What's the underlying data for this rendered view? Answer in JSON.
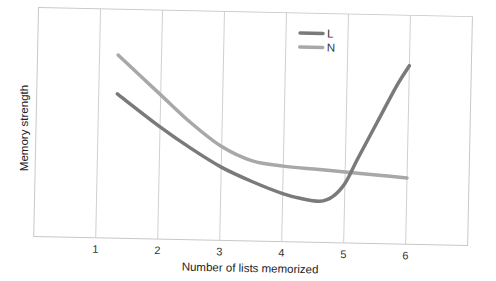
{
  "chart_data": {
    "type": "line",
    "title": "",
    "xlabel": "Number of lists memorized",
    "ylabel": "Memory strength",
    "xlim": [
      0,
      7
    ],
    "ylim": [
      0,
      10
    ],
    "x_ticks": [
      "1",
      "2",
      "3",
      "4",
      "5",
      "6"
    ],
    "grid": {
      "vertical": true,
      "horizontal": false
    },
    "legend_position": "upper-right",
    "series": [
      {
        "name": "L",
        "color": "#7a7a7a",
        "x": [
          1.3,
          2.0,
          2.5,
          3.0,
          3.5,
          4.0,
          4.3,
          4.6,
          4.8,
          5.0,
          5.2,
          5.5,
          5.8,
          6.0
        ],
        "y": [
          6.3,
          4.9,
          4.0,
          3.2,
          2.6,
          2.1,
          1.9,
          1.8,
          2.0,
          2.6,
          3.7,
          5.3,
          6.9,
          7.8
        ]
      },
      {
        "name": "N",
        "color": "#a8a8a8",
        "x": [
          1.3,
          2.0,
          2.5,
          3.0,
          3.5,
          4.0,
          4.5,
          5.0,
          5.5,
          6.0
        ],
        "y": [
          8.0,
          6.3,
          5.1,
          4.1,
          3.5,
          3.3,
          3.2,
          3.1,
          3.0,
          2.9
        ]
      }
    ]
  }
}
